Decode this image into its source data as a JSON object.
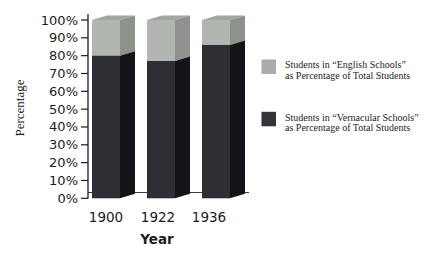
{
  "figure": {
    "background": "#ffffff"
  },
  "chart_data": {
    "type": "bar",
    "subtype": "3d-stacked-column",
    "stacked": true,
    "title": "",
    "xlabel": "Year",
    "ylabel": "Percentage",
    "ylim": [
      0,
      100
    ],
    "ytick_step": 10,
    "grid": false,
    "legend_position": "right",
    "categories": [
      "1900",
      "1922",
      "1936"
    ],
    "series": [
      {
        "name": "Students in “Vernacular Schools” as Percentage of Total Students",
        "values": [
          80,
          77,
          86
        ],
        "color": "#2e2f34"
      },
      {
        "name": "Students in “English Schools” as Percentage of Total Students",
        "values": [
          20,
          23,
          14
        ],
        "color": "#b2b6b1"
      }
    ],
    "yticks": [
      {
        "value": 0,
        "label": "0%"
      },
      {
        "value": 10,
        "label": "10%"
      },
      {
        "value": 20,
        "label": "20%"
      },
      {
        "value": 30,
        "label": "30%"
      },
      {
        "value": 40,
        "label": "40%"
      },
      {
        "value": 50,
        "label": "50%"
      },
      {
        "value": 60,
        "label": "60%"
      },
      {
        "value": 70,
        "label": "70%"
      },
      {
        "value": 80,
        "label": "80%"
      },
      {
        "value": 90,
        "label": "90%"
      },
      {
        "value": 100,
        "label": "100%"
      }
    ]
  },
  "legend": {
    "items": [
      {
        "swatch_color": "#ababab",
        "line1": "Students in “English Schools”",
        "line2": "as Percentage of Total Students"
      },
      {
        "swatch_color": "#333338",
        "line1": "Students in “Vernacular Schools”",
        "line2": "as Percentage of Total Students"
      }
    ]
  },
  "colors": {
    "english_front": "#b2b6b1",
    "english_side": "#8e928d",
    "english_top": "#a2a6a1",
    "vernacular_front": "#2e2f34",
    "vernacular_side": "#141418",
    "axis": "#1c1c1c",
    "back_line": "#3a3a3a",
    "text": "#1c1c1c"
  }
}
